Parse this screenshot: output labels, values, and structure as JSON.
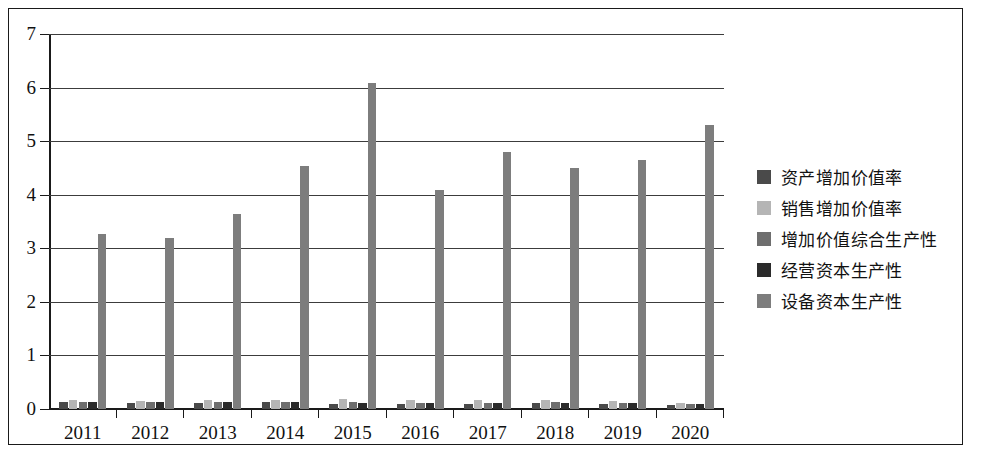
{
  "chart_data": {
    "type": "bar",
    "title": "",
    "xlabel": "",
    "ylabel": "",
    "ylim": [
      0,
      7
    ],
    "yticks": [
      0,
      1,
      2,
      3,
      4,
      5,
      6,
      7
    ],
    "grid": true,
    "legend_position": "right",
    "categories": [
      "2011",
      "2012",
      "2013",
      "2014",
      "2015",
      "2016",
      "2017",
      "2018",
      "2019",
      "2020"
    ],
    "series": [
      {
        "name": "资产增加价值率",
        "color": "#4a4a4a",
        "values": [
          0.13,
          0.12,
          0.12,
          0.13,
          0.1,
          0.1,
          0.1,
          0.11,
          0.1,
          0.08
        ]
      },
      {
        "name": "销售增加价值率",
        "color": "#b5b5b5",
        "values": [
          0.16,
          0.15,
          0.16,
          0.17,
          0.18,
          0.17,
          0.17,
          0.16,
          0.15,
          0.12
        ]
      },
      {
        "name": "增加价值综合生产性",
        "color": "#6e6e6e",
        "values": [
          0.14,
          0.13,
          0.13,
          0.13,
          0.13,
          0.12,
          0.12,
          0.13,
          0.12,
          0.1
        ]
      },
      {
        "name": "经营资本生产性",
        "color": "#2b2b2b",
        "values": [
          0.14,
          0.13,
          0.13,
          0.13,
          0.12,
          0.12,
          0.12,
          0.12,
          0.11,
          0.09
        ]
      },
      {
        "name": "设备资本生产性",
        "color": "#7d7d7d",
        "values": [
          3.27,
          3.19,
          3.64,
          4.54,
          6.08,
          4.08,
          4.79,
          4.5,
          4.64,
          5.3
        ]
      }
    ]
  }
}
